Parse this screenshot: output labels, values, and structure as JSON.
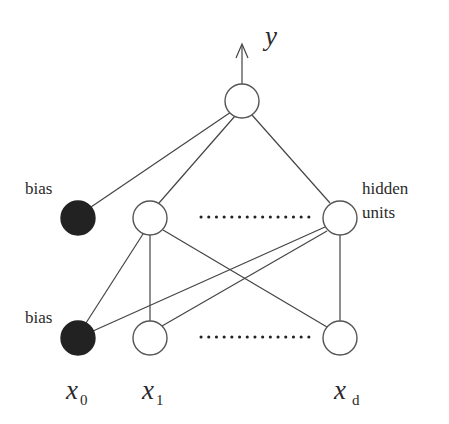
{
  "diagram": {
    "labels": {
      "output": "y",
      "bias_hidden": "bias",
      "bias_input": "bias",
      "hidden_line1": "hidden",
      "hidden_line2": "units",
      "x0_base": "x",
      "x0_sub": "0",
      "x1_base": "x",
      "x1_sub": "1",
      "xd_base": "x",
      "xd_sub": "d"
    },
    "nodes": [
      {
        "id": "output",
        "layer": "output",
        "cx": 242,
        "cy": 101,
        "filled": false
      },
      {
        "id": "hidden-bias",
        "layer": "hidden",
        "cx": 78,
        "cy": 218,
        "filled": true
      },
      {
        "id": "hidden-1",
        "layer": "hidden",
        "cx": 150,
        "cy": 218,
        "filled": false
      },
      {
        "id": "hidden-d",
        "layer": "hidden",
        "cx": 340,
        "cy": 218,
        "filled": false
      },
      {
        "id": "input-bias",
        "layer": "input",
        "cx": 78,
        "cy": 338,
        "filled": true
      },
      {
        "id": "input-1",
        "layer": "input",
        "cx": 150,
        "cy": 338,
        "filled": false
      },
      {
        "id": "input-d",
        "layer": "input",
        "cx": 340,
        "cy": 338,
        "filled": false
      }
    ],
    "edges": [
      [
        "output",
        "hidden-bias"
      ],
      [
        "output",
        "hidden-1"
      ],
      [
        "output",
        "hidden-d"
      ],
      [
        "hidden-1",
        "input-bias"
      ],
      [
        "hidden-1",
        "input-1"
      ],
      [
        "hidden-1",
        "input-d"
      ],
      [
        "hidden-d",
        "input-bias"
      ],
      [
        "hidden-d",
        "input-1"
      ],
      [
        "hidden-d",
        "input-d"
      ]
    ],
    "colors": {
      "bias_fill": "#222222",
      "node_stroke": "#555555",
      "edge": "#444444",
      "background": "#ffffff"
    }
  }
}
